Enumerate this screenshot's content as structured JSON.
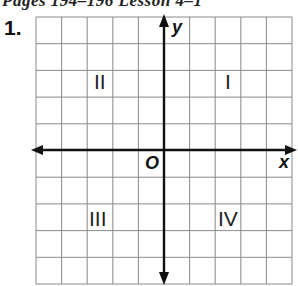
{
  "header": {
    "text": "Pages 194–196   Lesson 4–1"
  },
  "problem": {
    "number": "1."
  },
  "diagram": {
    "type": "coordinate-plane",
    "grid": {
      "columns": 10,
      "rows": 10,
      "line_color": "#8a8a8a"
    },
    "axes": {
      "x_label": "x",
      "y_label": "y",
      "origin_label": "O",
      "color": "#111111"
    },
    "quadrants": [
      {
        "label": "I",
        "position": "top-right"
      },
      {
        "label": "II",
        "position": "top-left"
      },
      {
        "label": "III",
        "position": "bottom-left"
      },
      {
        "label": "IV",
        "position": "bottom-right"
      }
    ]
  }
}
